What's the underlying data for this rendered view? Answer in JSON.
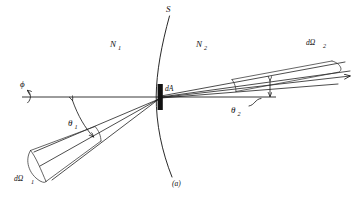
{
  "figure": {
    "caption": "(a)",
    "background_color": "#ffffff",
    "ink_color": "#111111",
    "width": 361,
    "height": 210
  },
  "labels": {
    "surface": "S",
    "medium_left": "N",
    "medium_left_sub": "1",
    "medium_right": "N",
    "medium_right_sub": "2",
    "area_element": "dA",
    "azimuth": "ϕ",
    "theta_left": "θ",
    "theta_left_sub": "1",
    "theta_right": "θ",
    "theta_right_sub": "2",
    "solid_angle_left": "dΩ",
    "solid_angle_left_sub": "1",
    "solid_angle_right": "dΩ",
    "solid_angle_right_sub": "2"
  },
  "geometry": {
    "origin_x": 160,
    "origin_y": 97,
    "axis_left_start_x": 22,
    "axis_right_end_x": 276,
    "theta_left_degrees": 35,
    "theta_right_degrees": 17,
    "da_bar_width": 5,
    "da_bar_height": 26
  }
}
